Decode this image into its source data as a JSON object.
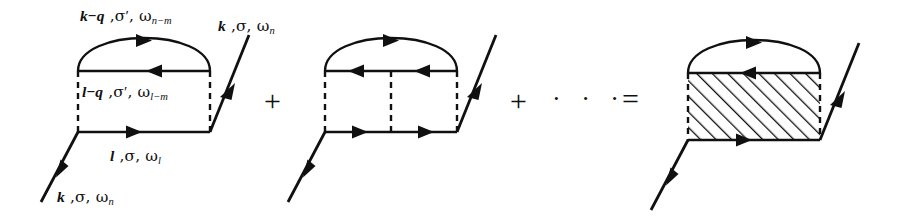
{
  "figure": {
    "kind": "feynman-diagram-series",
    "background_color": "#ffffff",
    "ink_color": "#101010",
    "width": 904,
    "height": 223
  },
  "labels": {
    "top_arc_line": {
      "momentum": "k−q",
      "spin": "σ′",
      "frequency": "ω",
      "frequency_index": "n−m",
      "text": "k−q , σ′, ω n−m"
    },
    "middle_line": {
      "momentum": "l−q",
      "spin": "σ′",
      "frequency": "ω",
      "frequency_index": "l−m",
      "text": "l−q , σ′, ω l−m"
    },
    "bottom_line": {
      "momentum": "l",
      "spin": "σ",
      "frequency": "ω",
      "frequency_index": "l",
      "text": "l , σ, ω l"
    },
    "incoming_leg": {
      "momentum": "k",
      "spin": "σ",
      "frequency": "ω",
      "frequency_index": "n",
      "text": "k , σ, ω n"
    },
    "outgoing_leg": {
      "momentum": "k",
      "spin": "σ",
      "frequency": "ω",
      "frequency_index": "n",
      "text": "k , σ, ω n"
    }
  },
  "operators": {
    "plus_first": "+",
    "plus_second": "+",
    "ellipsis": "· · ·",
    "equals": "="
  },
  "diagrams": [
    {
      "name": "first-order-ladder-diagram",
      "rungs": 2,
      "has_hatched_block": false,
      "interaction_lines": [
        "left-dashed",
        "right-dashed"
      ],
      "propagators": [
        "top-arc",
        "middle-horizontal",
        "bottom-horizontal",
        "incoming-leg",
        "outgoing-leg"
      ]
    },
    {
      "name": "second-order-ladder-diagram",
      "rungs": 3,
      "has_hatched_block": false,
      "interaction_lines": [
        "left-dashed",
        "center-dashed",
        "right-dashed"
      ],
      "propagators": [
        "top-arc",
        "middle-horizontal",
        "bottom-horizontal",
        "incoming-leg",
        "outgoing-leg"
      ]
    },
    {
      "name": "resummed-vertex-diagram",
      "rungs": 0,
      "has_hatched_block": true,
      "interaction_lines": [
        "left-dashed-border",
        "right-dashed-border"
      ],
      "propagators": [
        "top-arc",
        "middle-horizontal",
        "bottom-horizontal",
        "incoming-leg",
        "outgoing-leg"
      ]
    }
  ]
}
